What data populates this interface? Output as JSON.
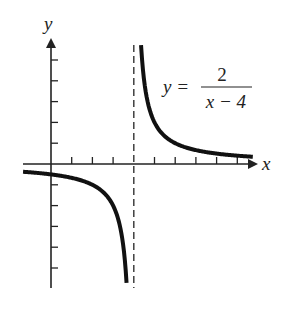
{
  "chart_data": {
    "type": "line",
    "title": "",
    "function": "y = 2/(x - 4)",
    "equation": {
      "lhs": "y =",
      "numerator": "2",
      "denominator": "x − 4"
    },
    "xlabel": "x",
    "ylabel": "y",
    "xlim": [
      -1.4,
      10.3
    ],
    "ylim": [
      -6,
      6
    ],
    "x_ticks": [
      1,
      2,
      3,
      4,
      5,
      6,
      7,
      8,
      9
    ],
    "y_ticks": [
      -5,
      -4,
      -3,
      -2,
      -1,
      1,
      2,
      3,
      4,
      5
    ],
    "tick_labels_shown": false,
    "grid": false,
    "vertical_asymptote": 4,
    "horizontal_asymptote": 0,
    "series": [
      {
        "name": "left branch",
        "x": [
          -1.35,
          -1,
          0,
          1,
          2,
          3,
          3.5,
          3.65
        ],
        "y": [
          -0.37,
          -0.4,
          -0.5,
          -0.67,
          -1,
          -2,
          -4,
          -5.7
        ]
      },
      {
        "name": "right branch",
        "x": [
          4.35,
          4.5,
          5,
          6,
          7,
          8,
          9,
          9.75
        ],
        "y": [
          5.7,
          4,
          2,
          1,
          0.67,
          0.5,
          0.4,
          0.35
        ]
      }
    ],
    "colors": {
      "curve": "#111111",
      "axes": "#222222",
      "asymptote": "#333333"
    }
  },
  "labels": {
    "x_axis": "x",
    "y_axis": "y",
    "eq_lhs": "y =",
    "eq_num": "2",
    "eq_den": "x − 4"
  }
}
